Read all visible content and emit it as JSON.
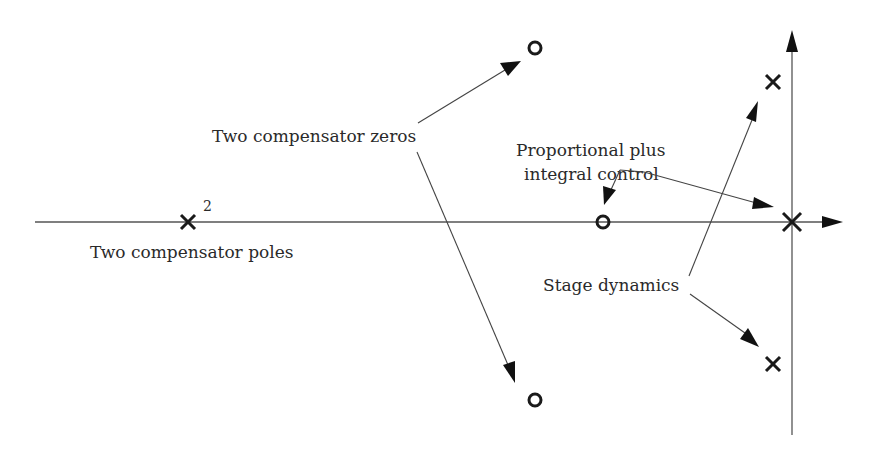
{
  "figure": {
    "labels": {
      "compensator_zeros": "Two compensator zeros",
      "compensator_poles": "Two compensator poles",
      "pi_control_line1": "Proportional plus",
      "pi_control_line2": "integral control",
      "stage_dynamics": "Stage dynamics",
      "pole_multiplicity": "2"
    },
    "axes": {
      "real_axis": {
        "x1": 35,
        "y": 222,
        "x2": 843
      },
      "imag_axis": {
        "x": 792,
        "y1": 435,
        "y2": 30
      }
    },
    "poles": [
      {
        "name": "compensator-double-pole",
        "x": 188,
        "y": 222,
        "multiplicity": 2
      },
      {
        "name": "stage-pole-upper",
        "x": 773,
        "y": 82
      },
      {
        "name": "stage-pole-lower",
        "x": 773,
        "y": 364
      },
      {
        "name": "integrator-pole-origin",
        "x": 792,
        "y": 222
      }
    ],
    "zeros": [
      {
        "name": "compensator-zero-upper",
        "x": 535,
        "y": 48
      },
      {
        "name": "compensator-zero-lower",
        "x": 535,
        "y": 400
      },
      {
        "name": "pi-zero",
        "x": 603,
        "y": 222
      }
    ],
    "colors": {
      "ink": "#1a1a1a",
      "axis": "#555555",
      "background": "#ffffff"
    }
  }
}
